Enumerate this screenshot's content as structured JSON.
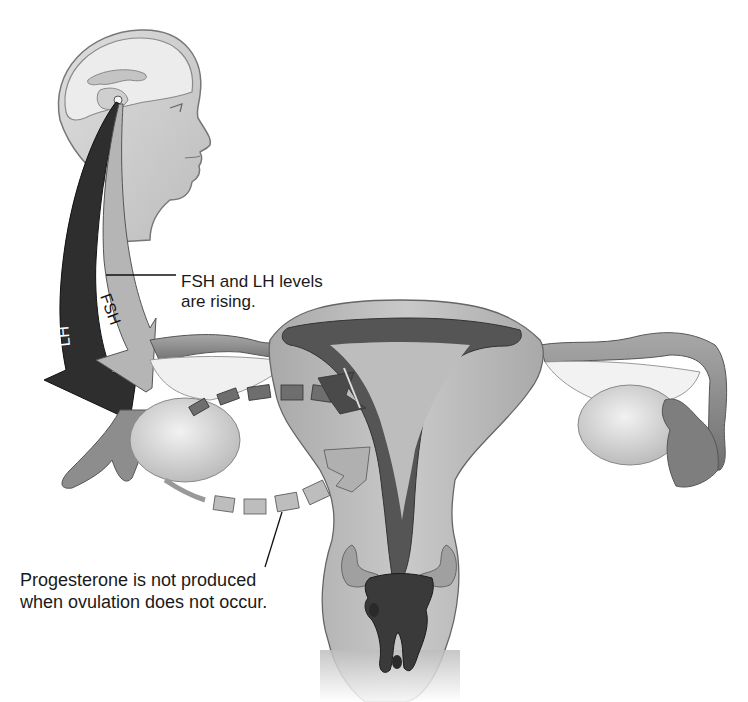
{
  "figure": {
    "type": "anatomical-diagram"
  },
  "labels": {
    "fsh_lh_callout": "FSH and LH levels\nare rising.",
    "progesterone_callout": "Progesterone is not produced\nwhen ovulation does not occur."
  },
  "arrows": {
    "fsh": "FSH",
    "lh": "LH"
  },
  "colors": {
    "background": "#ffffff",
    "skin": "#c9c9c9",
    "brain": "#e6e6e6",
    "uterus_wall": "#bdbdbd",
    "endometrium": "#5a5a5a",
    "tube": "#8a8a8a",
    "ovary": "#dcdcdc",
    "lh_arrow": "#2a2a2a",
    "fsh_arrow": "#b0b0b0",
    "dashed_hormone": "#6e6e6e",
    "dashed_absent": "#b8b8b8",
    "text": "#1a1a1a"
  }
}
